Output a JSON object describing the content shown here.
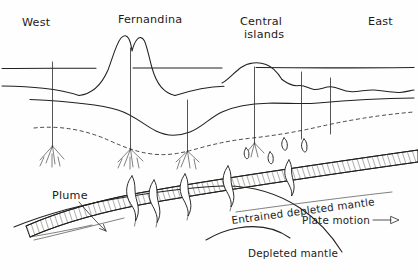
{
  "figure": {
    "kind": "hand-drawn geological cross-section"
  },
  "orientation": {
    "west_label": "West",
    "east_label": "East"
  },
  "features": {
    "fernandina_label": "Fernandina",
    "central_islands_line1": "Central",
    "central_islands_line2": "islands"
  },
  "annotations": {
    "plume_label": "Plume",
    "entrained_label": "Entrained depleted mantle",
    "plate_motion_label": "Plate motion",
    "depleted_label": "Depleted mantle"
  },
  "icons": {
    "plate_motion_arrow": "arrow-right-icon",
    "plume_leader_arrow": "arrow-leader-icon"
  },
  "colors": {
    "ink": "#23211f",
    "paper": "#fefefe"
  }
}
